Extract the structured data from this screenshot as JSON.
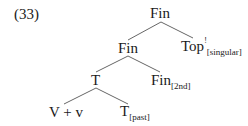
{
  "example_number": "(33)",
  "tree": {
    "root": {
      "label": "Fin"
    },
    "fin2": {
      "label": "Fin"
    },
    "top": {
      "label": "Top",
      "superscript": "!",
      "subscript": "[singular]"
    },
    "t": {
      "label": "T"
    },
    "fin3": {
      "label": "Fin",
      "subscript": "[2nd]"
    },
    "vv": {
      "label": "V + v"
    },
    "tpast": {
      "label": "T",
      "subscript": "[past]"
    }
  }
}
